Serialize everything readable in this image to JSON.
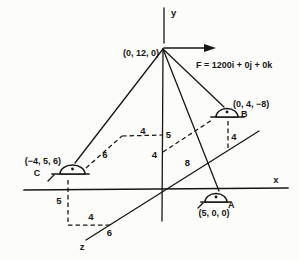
{
  "diagram": {
    "axes": {
      "x": "x",
      "y": "y",
      "z": "z"
    },
    "apex_label": "(0, 12, 0)",
    "force_label": "F = 1200i + 0j + 0k",
    "points": {
      "A": {
        "name": "A",
        "coords": "(5, 0, 0)"
      },
      "B": {
        "name": "B",
        "coords": "(0, 4, −8)"
      },
      "C": {
        "name": "C",
        "coords": "(−4, 5, 6)"
      }
    },
    "dims": {
      "c_z_offset": "6",
      "c_x_offset": "4",
      "y_height_5": "5",
      "y_height_4": "4",
      "b_z_offset": "8",
      "b_y_height": "4",
      "c_drop_y": "5",
      "c_drop_x": "4",
      "c_drop_z": "6"
    },
    "ink_color": "#161616",
    "background_color": "#fcfcfa"
  }
}
